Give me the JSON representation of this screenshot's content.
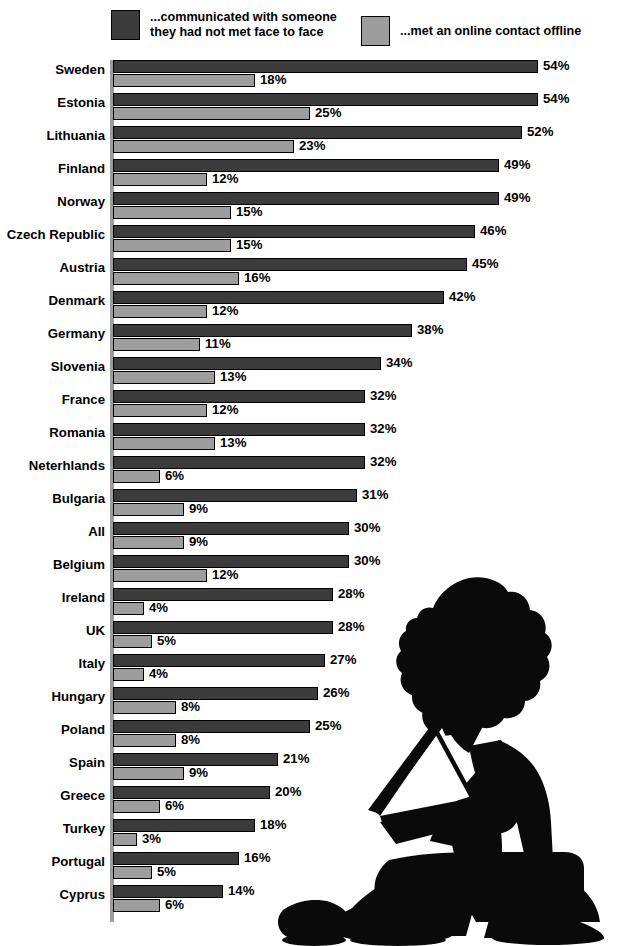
{
  "legend": {
    "items": [
      {
        "label": "...communicated with someone\nthey had not met face to face",
        "color": "#3b3b3b",
        "icon": "dark-swatch-icon"
      },
      {
        "label": "...met an online contact offline",
        "color": "#9d9d9d",
        "icon": "light-swatch-icon"
      }
    ]
  },
  "chart_data": {
    "type": "bar",
    "orientation": "horizontal",
    "title": "",
    "subtitle": "",
    "xlabel": "",
    "ylabel": "",
    "xlim": [
      0,
      54
    ],
    "grid": false,
    "legend_position": "top",
    "value_suffix": "%",
    "categories": [
      "Sweden",
      "Estonia",
      "Lithuania",
      "Finland",
      "Norway",
      "Czech Republic",
      "Austria",
      "Denmark",
      "Germany",
      "Slovenia",
      "France",
      "Romania",
      "Neterhlands",
      "Bulgaria",
      "All",
      "Belgium",
      "Ireland",
      "UK",
      "Italy",
      "Hungary",
      "Poland",
      "Spain",
      "Greece",
      "Turkey",
      "Portugal",
      "Cyprus"
    ],
    "series": [
      {
        "name": "...communicated with someone they had not met face to face",
        "color": "#3b3b3b",
        "values": [
          54,
          54,
          52,
          49,
          49,
          46,
          45,
          42,
          38,
          34,
          32,
          32,
          32,
          31,
          30,
          30,
          28,
          28,
          27,
          26,
          25,
          21,
          20,
          18,
          16,
          14
        ],
        "labels": [
          "54%",
          "54%",
          "52%",
          "49%",
          "49%",
          "46%",
          "45%",
          "42%",
          "38%",
          "34%",
          "32%",
          "32%",
          "32%",
          "31%",
          "30%",
          "30%",
          "28%",
          "28%",
          "27%",
          "26%",
          "25%",
          "21%",
          "20%",
          "18%",
          "16%",
          "14%"
        ]
      },
      {
        "name": "...met an online contact offline",
        "color": "#9d9d9d",
        "values": [
          18,
          25,
          23,
          12,
          15,
          15,
          16,
          12,
          11,
          13,
          12,
          13,
          6,
          9,
          9,
          12,
          4,
          5,
          4,
          8,
          8,
          9,
          6,
          3,
          5,
          6
        ],
        "labels": [
          "18%",
          "25%",
          "23%",
          "12%",
          "15%",
          "15%",
          "16%",
          "12%",
          "11%",
          "13%",
          "12%",
          "13%",
          "6%",
          "9%",
          "9%",
          "12%",
          "4%",
          "5%",
          "4%",
          "8%",
          "8%",
          "9%",
          "6%",
          "3%",
          "5%",
          "6%"
        ]
      }
    ]
  },
  "decoration": {
    "silhouette": "person-with-laptop-silhouette"
  }
}
